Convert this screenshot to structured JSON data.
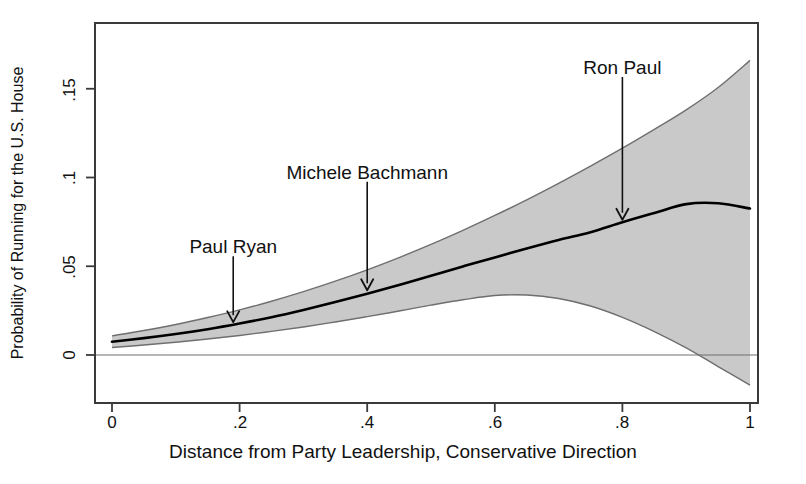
{
  "chart_data": {
    "type": "line",
    "title": "",
    "subtitle": "",
    "xlabel": "Distance from Party Leadership, Conservative Direction",
    "ylabel": "Probability of Running for the U.S. House",
    "xlim": [
      0,
      1
    ],
    "ylim": [
      -0.027,
      0.1785
    ],
    "xticks": [
      "0",
      ".2",
      ".4",
      ".6",
      ".8",
      "1"
    ],
    "xtick_values": [
      0,
      0.2,
      0.4,
      0.6,
      0.8,
      1
    ],
    "yticks": [
      "0",
      ".05",
      ".1",
      ".15"
    ],
    "ytick_values": [
      0,
      0.05,
      0.1,
      0.15
    ],
    "grid": false,
    "legend": "none",
    "zero_reference_line": 0,
    "x": [
      0,
      0.05,
      0.1,
      0.15,
      0.2,
      0.25,
      0.3,
      0.35,
      0.4,
      0.45,
      0.5,
      0.55,
      0.6,
      0.65,
      0.7,
      0.75,
      0.8,
      0.85,
      0.9,
      0.95,
      1
    ],
    "series": [
      {
        "name": "Predicted probability",
        "style": "solid-line",
        "color": "#000000",
        "values": [
          0.0075,
          0.0095,
          0.0118,
          0.0145,
          0.0177,
          0.0213,
          0.0254,
          0.0298,
          0.0345,
          0.0395,
          0.0447,
          0.0499,
          0.055,
          0.06,
          0.0648,
          0.0692,
          0.0748,
          0.08,
          0.085,
          0.0855,
          0.0825
        ]
      },
      {
        "name": "Upper 95% confidence bound",
        "style": "band-edge",
        "color": "#7a7a7a",
        "values": [
          0.0108,
          0.0138,
          0.0172,
          0.0211,
          0.0254,
          0.0303,
          0.0357,
          0.0416,
          0.048,
          0.0549,
          0.0623,
          0.0702,
          0.0786,
          0.0874,
          0.0967,
          0.1064,
          0.1165,
          0.1271,
          0.1381,
          0.1507,
          0.166
        ]
      },
      {
        "name": "Lower 95% confidence bound",
        "style": "band-edge",
        "color": "#7a7a7a",
        "values": [
          0.0042,
          0.0056,
          0.0072,
          0.009,
          0.011,
          0.0133,
          0.0158,
          0.0186,
          0.0216,
          0.0248,
          0.0281,
          0.0311,
          0.0335,
          0.0338,
          0.0318,
          0.0276,
          0.0212,
          0.0132,
          0.004,
          -0.0065,
          -0.017
        ]
      }
    ],
    "band_fill_color": "#c9c9c9",
    "annotations": [
      {
        "label": "Paul Ryan",
        "x": 0.19,
        "y": 0.0168,
        "label_x": 0.19,
        "label_y": 0.059,
        "arrow": "down"
      },
      {
        "label": "Michele Bachmann",
        "x": 0.4,
        "y": 0.0348,
        "label_x": 0.4,
        "label_y": 0.101,
        "arrow": "down"
      },
      {
        "label": "Ron Paul",
        "x": 0.8,
        "y": 0.0745,
        "label_x": 0.8,
        "label_y": 0.16,
        "arrow": "down"
      }
    ]
  },
  "figure": {
    "name": "predicted-probability-of-running-for-us-house",
    "background_color": "#ffffff",
    "frame_color": "#3a3a3a"
  }
}
